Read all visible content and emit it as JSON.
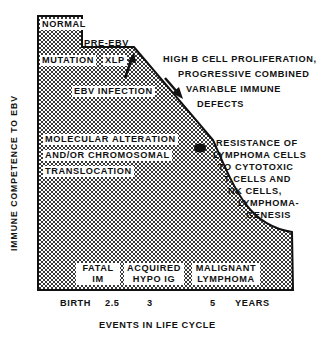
{
  "y_axis_label": "IMMUNE COMPETENCE TO EBV",
  "x_axis_label": "EVENTS IN LIFE CYCLE",
  "x_ticks": [
    "BIRTH",
    "2.5",
    "3",
    "5",
    "YEARS"
  ],
  "stages": {
    "normal": "NORMAL",
    "pre_ebv": "PRE-EBV",
    "mutation": "MUTATION",
    "xlp": "XLP",
    "ebv_infection": "EBV INFECTION",
    "molecular": [
      "MOLECULAR ALTERATION",
      "AND/OR CHROMOSOMAL",
      "TRANSLOCATION"
    ]
  },
  "annotations": {
    "proliferation": [
      "HIGH B CELL PROLIFERATION,",
      "PROGRESSIVE COMBINED",
      "VARIABLE IMMUNE",
      "DEFECTS"
    ],
    "resistance": [
      "RESISTANCE OF",
      "LYMPHOMA CELLS",
      "TO CYTOTOXIC",
      "T CELLS AND",
      "NK CELLS,",
      "LYMPHOMA-",
      "GENESIS"
    ]
  },
  "outcomes": [
    {
      "line1": "FATAL",
      "line2": "IM"
    },
    {
      "line1": "ACQUIRED",
      "line2": "HYPO IG"
    },
    {
      "line1": "MALIGNANT",
      "line2": "LYMPHOMA"
    }
  ]
}
